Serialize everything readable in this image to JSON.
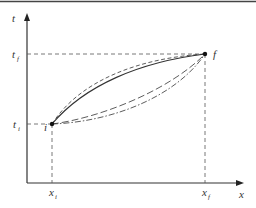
{
  "diagram": {
    "type": "space-time paths diagram",
    "axes": {
      "vertical_label": "t",
      "horizontal_label": "x"
    },
    "points": [
      {
        "id": "i",
        "label": "i",
        "x_label": "x",
        "x_sub": "i",
        "t_label": "t",
        "t_sub": "i"
      },
      {
        "id": "f",
        "label": "f",
        "x_label": "x",
        "x_sub": "f",
        "t_label": "t",
        "t_sub": "f"
      }
    ],
    "paths": [
      {
        "style": "solid",
        "description": "upper arc from i to f"
      },
      {
        "style": "dashed",
        "description": "upper arc slightly above solid"
      },
      {
        "style": "long-dash",
        "description": "lower arc from i to f"
      },
      {
        "style": "dash-dot",
        "description": "lower arc from i to f"
      }
    ],
    "colors": {
      "line": "#333333",
      "guide": "#555555",
      "border": "#444444"
    }
  }
}
